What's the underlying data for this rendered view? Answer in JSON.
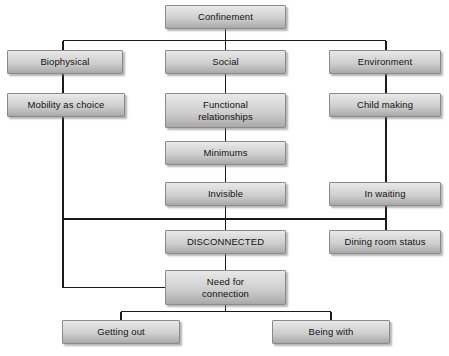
{
  "diagram": {
    "type": "hierarchical-flowchart",
    "background_color": "#ffffff",
    "node_fill_top": "#e9e9e9",
    "node_fill_bottom": "#a8a8a8",
    "node_border_color": "#8a8a8a",
    "connector_color": "#1a1a1a",
    "nodes": [
      {
        "id": "confinement",
        "label": "Confinement",
        "x": 165,
        "y": 5,
        "w": 121,
        "h": 24
      },
      {
        "id": "biophysical",
        "label": "Biophysical",
        "x": 7,
        "y": 50,
        "w": 116,
        "h": 24
      },
      {
        "id": "social",
        "label": "Social",
        "x": 165,
        "y": 50,
        "w": 121,
        "h": 24
      },
      {
        "id": "environment",
        "label": "Environment",
        "x": 329,
        "y": 50,
        "w": 112,
        "h": 24
      },
      {
        "id": "mobility",
        "label": "Mobility as choice",
        "x": 7,
        "y": 93,
        "w": 118,
        "h": 24
      },
      {
        "id": "functional",
        "label": "Functional\nrelationships",
        "x": 165,
        "y": 93,
        "w": 121,
        "h": 35
      },
      {
        "id": "child-making",
        "label": "Child making",
        "x": 329,
        "y": 93,
        "w": 112,
        "h": 24
      },
      {
        "id": "minimums",
        "label": "Minimums",
        "x": 165,
        "y": 141,
        "w": 121,
        "h": 24
      },
      {
        "id": "invisible",
        "label": "Invisible",
        "x": 165,
        "y": 182,
        "w": 121,
        "h": 24
      },
      {
        "id": "in-waiting",
        "label": "In waiting",
        "x": 329,
        "y": 182,
        "w": 112,
        "h": 24
      },
      {
        "id": "disconnected",
        "label": "DISCONNECTED",
        "x": 165,
        "y": 230,
        "w": 121,
        "h": 24
      },
      {
        "id": "dining-room-status",
        "label": "Dining room status",
        "x": 329,
        "y": 230,
        "w": 112,
        "h": 24
      },
      {
        "id": "need-for-connection",
        "label": "Need for\nconnection",
        "x": 165,
        "y": 270,
        "w": 121,
        "h": 35
      },
      {
        "id": "getting-out",
        "label": "Getting out",
        "x": 62,
        "y": 320,
        "w": 118,
        "h": 24
      },
      {
        "id": "being-with",
        "label": "Being with",
        "x": 272,
        "y": 320,
        "w": 118,
        "h": 24
      }
    ],
    "edges": [
      {
        "from": "confinement",
        "to": "biophysical"
      },
      {
        "from": "confinement",
        "to": "social"
      },
      {
        "from": "confinement",
        "to": "environment"
      },
      {
        "from": "biophysical",
        "to": "mobility"
      },
      {
        "from": "social",
        "to": "functional"
      },
      {
        "from": "environment",
        "to": "child-making"
      },
      {
        "from": "functional",
        "to": "minimums"
      },
      {
        "from": "minimums",
        "to": "invisible"
      },
      {
        "from": "child-making",
        "to": "in-waiting"
      },
      {
        "from": "invisible",
        "to": "disconnected"
      },
      {
        "from": "in-waiting",
        "to": "dining-room-status"
      },
      {
        "from": "mobility",
        "to": "need-for-connection"
      },
      {
        "from": "disconnected",
        "to": "need-for-connection"
      },
      {
        "from": "need-for-connection",
        "to": "getting-out"
      },
      {
        "from": "need-for-connection",
        "to": "being-with"
      }
    ]
  }
}
